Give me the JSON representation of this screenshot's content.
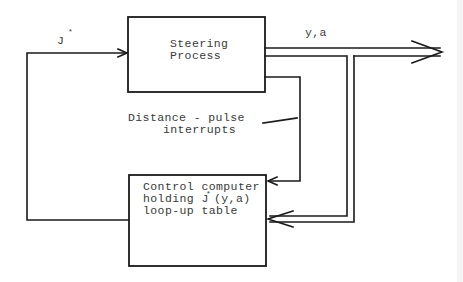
{
  "diagram": {
    "type": "block-diagram",
    "colors": {
      "line": "#1a1a1a",
      "text": "#3a3a3a",
      "background": "#ffffff"
    },
    "blocks": {
      "steering": {
        "line1": "Steering",
        "line2": "Process"
      },
      "computer": {
        "line1": "Control computer",
        "line2_prefix": "holding J",
        "line2_sup": "*",
        "line2_suffix": "(y,a)",
        "line3": "loop-up table"
      }
    },
    "labels": {
      "feedback": "J",
      "feedback_sup": "*",
      "output": "y,a",
      "interrupts_line1": "Distance - pulse",
      "interrupts_line2": "interrupts"
    },
    "connections": [
      {
        "from": "computer",
        "to": "steering",
        "label": "J*",
        "style": "single-arrow"
      },
      {
        "from": "steering",
        "to": "output",
        "label": "y,a",
        "style": "double-arrow"
      },
      {
        "from": "output",
        "to": "computer",
        "label": "y,a",
        "style": "double-arrow"
      },
      {
        "from": "steering",
        "to": "computer",
        "label": "Distance - pulse interrupts",
        "style": "single-arrow"
      }
    ]
  }
}
